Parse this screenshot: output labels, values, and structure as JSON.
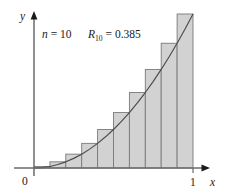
{
  "figure": {
    "name": "riemann-sum-right-endpoints",
    "background_color": "#ffffff"
  },
  "annotation": {
    "n_var": "n",
    "n_eq": " = ",
    "n_value": "10",
    "r_var": "R",
    "r_sub": "10",
    "r_eq": " = ",
    "r_value": "0.385",
    "full_text": "n = 10   R10 = 0.385"
  },
  "axes": {
    "y_label": "y",
    "x_label": "x",
    "origin_label": "0",
    "x_tick_label": "1",
    "axis_color": "#6b6b6b",
    "x_range": [
      0,
      1
    ],
    "y_range": [
      0,
      1
    ]
  },
  "chart_data": {
    "type": "bar",
    "title": "",
    "subtitle": "",
    "xlabel": "x",
    "ylabel": "y",
    "xlim": [
      0,
      1
    ],
    "ylim": [
      0,
      1
    ],
    "grid": false,
    "legend": null,
    "annotations": [
      "n = 10",
      "R10 = 0.385"
    ],
    "bar_fill_color": "#d2d2d2",
    "bar_stroke_color": "#7a7a7a",
    "curve_color": "#4a4a4a",
    "curve_expression": "y = x^2",
    "method": "right-endpoint Riemann sum",
    "n_rectangles": 10,
    "sum_value": 0.385,
    "categories": [
      "0.1",
      "0.2",
      "0.3",
      "0.4",
      "0.5",
      "0.6",
      "0.7",
      "0.8",
      "0.9",
      "1.0"
    ],
    "bar_left_edges": [
      0.0,
      0.1,
      0.2,
      0.3,
      0.4,
      0.5,
      0.6,
      0.7,
      0.8,
      0.9
    ],
    "bar_right_edges": [
      0.1,
      0.2,
      0.3,
      0.4,
      0.5,
      0.6,
      0.7,
      0.8,
      0.9,
      1.0
    ],
    "values": [
      0.01,
      0.04,
      0.09,
      0.16,
      0.25,
      0.36,
      0.49,
      0.64,
      0.81,
      1.0
    ],
    "curve_x": [
      0.0,
      0.05,
      0.1,
      0.15,
      0.2,
      0.25,
      0.3,
      0.35,
      0.4,
      0.45,
      0.5,
      0.55,
      0.6,
      0.65,
      0.7,
      0.75,
      0.8,
      0.85,
      0.9,
      0.95,
      1.0
    ],
    "curve_y": [
      0.0,
      0.0025,
      0.01,
      0.0225,
      0.04,
      0.0625,
      0.09,
      0.1225,
      0.16,
      0.2025,
      0.25,
      0.3025,
      0.36,
      0.4225,
      0.49,
      0.5625,
      0.64,
      0.7225,
      0.81,
      0.9025,
      1.0
    ]
  }
}
